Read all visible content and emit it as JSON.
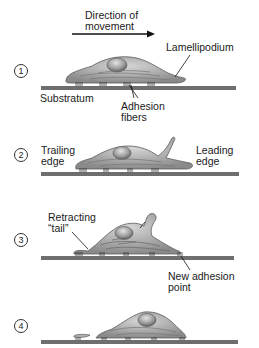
{
  "title": {
    "direction_line1": "Direction of",
    "direction_line2": "movement"
  },
  "steps": [
    {
      "number": "1",
      "labels": {
        "lamellipodium": "Lamellipodium",
        "substratum": "Substratum",
        "adhesion_line1": "Adhesion",
        "adhesion_line2": "fibers"
      }
    },
    {
      "number": "2",
      "labels": {
        "trailing_line1": "Trailing",
        "trailing_line2": "edge",
        "leading_line1": "Leading",
        "leading_line2": "edge"
      }
    },
    {
      "number": "3",
      "labels": {
        "retracting_line1": "Retracting",
        "retracting_line2": "“tail”",
        "new_adhesion_line1": "New adhesion",
        "new_adhesion_line2": "point"
      }
    },
    {
      "number": "4",
      "labels": {}
    }
  ],
  "colors": {
    "substratum": "#6e6e6e",
    "cell_fill": "#a8a8a8",
    "cell_stroke": "#5a5a5a",
    "nucleus": "#8c8c8c"
  }
}
